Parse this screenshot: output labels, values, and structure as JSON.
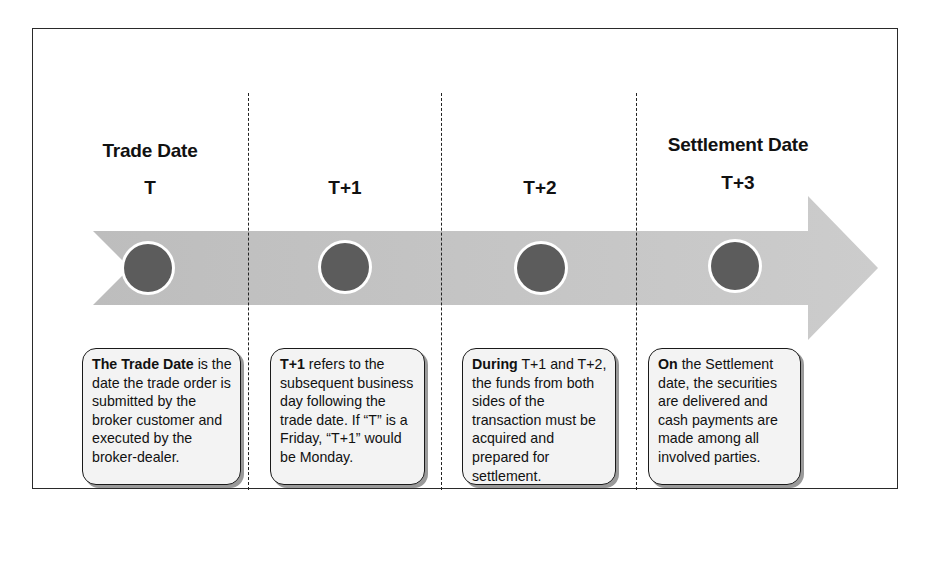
{
  "diagram": {
    "type": "timeline",
    "colors": {
      "frame_border": "#2a2a2a",
      "arrow_fill": "#c2c2c2",
      "circle_fill": "#5c5c5c",
      "circle_ring": "#ffffff",
      "box_fill": "#f3f3f3",
      "box_border": "#1a1a1a",
      "divider": "#222222"
    },
    "stages": [
      {
        "title": "Trade Date",
        "step": "T",
        "desc_bold": "The Trade Date",
        "desc_rest": " is the date the trade order is submitted by the broker customer and executed by the broker-dealer."
      },
      {
        "title": "",
        "step": "T+1",
        "desc_bold": "T+1",
        "desc_rest": " refers to the subsequent business day following the trade date. If “T” is a Friday, “T+1” would be Monday."
      },
      {
        "title": "",
        "step": "T+2",
        "desc_bold": "During",
        "desc_rest": " T+1 and T+2, the funds from both sides of the transaction must be acquired and prepared for settlement."
      },
      {
        "title": "Settlement Date",
        "step": "T+3",
        "desc_bold": "On",
        "desc_rest": " the Settlement date, the securities are delivered and cash payments are made among all involved parties."
      }
    ]
  }
}
